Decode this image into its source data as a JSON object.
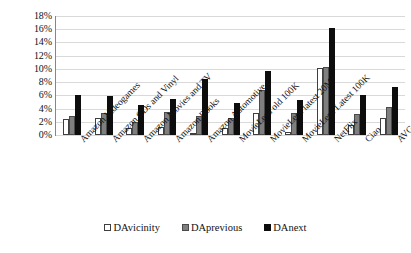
{
  "chart_data": {
    "type": "bar",
    "title": "",
    "xlabel": "",
    "ylabel": "",
    "ylim": [
      0,
      18
    ],
    "ytick_labels": [
      "18%",
      "16%",
      "14%",
      "12%",
      "10%",
      "8%",
      "6%",
      "4%",
      "2%",
      "0%"
    ],
    "ytick_values": [
      18,
      16,
      14,
      12,
      10,
      8,
      6,
      4,
      2,
      0
    ],
    "grid": true,
    "legend_position": "bottom",
    "categories": [
      "Amazon Videogames",
      "Amazon CDs and Vinyl",
      "Amazon Movies and TV",
      "Amazon Books",
      "Amazon Automotive",
      "MovieLens old 100K",
      "MovieLens latest 20M",
      "MovieLens Latest 100K",
      "NetFlix",
      "Ciao",
      "AVG"
    ],
    "series": [
      {
        "name": "DAvicinity",
        "color": "#ffffff",
        "values": [
          2.4,
          2.5,
          1.1,
          1.2,
          0.3,
          1.0,
          3.3,
          0.5,
          10.1,
          1.5,
          2.6
        ]
      },
      {
        "name": "DAprevious",
        "color": "#7f7f7f",
        "values": [
          2.9,
          3.3,
          2.0,
          3.5,
          2.9,
          2.6,
          6.8,
          3.3,
          10.3,
          3.2,
          4.2
        ]
      },
      {
        "name": "DAnext",
        "color": "#0d0d0d",
        "values": [
          6.0,
          5.9,
          4.6,
          5.5,
          8.5,
          4.8,
          9.7,
          5.3,
          16.2,
          6.1,
          7.3
        ]
      }
    ]
  }
}
